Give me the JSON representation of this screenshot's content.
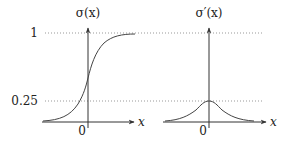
{
  "figure": {
    "left_plot": {
      "title": "σ(x)",
      "y_ticks": [
        {
          "label": "1",
          "value": 1
        },
        {
          "label": "0.25",
          "value": 0.25
        }
      ],
      "x_axis_label": "x",
      "origin_label": "0",
      "curve": "sigmoid"
    },
    "right_plot": {
      "title": "σ′(x)",
      "x_axis_label": "x",
      "origin_label": "0",
      "curve": "sigmoid-derivative",
      "peak_value": 0.25
    }
  }
}
